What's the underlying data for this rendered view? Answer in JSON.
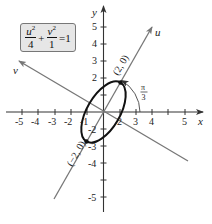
{
  "diagram": {
    "equation": {
      "u_term": {
        "var": "u",
        "exp": "2",
        "den": "4"
      },
      "plus": "+",
      "v_term": {
        "var": "v",
        "exp": "2",
        "den": "1"
      },
      "equals": "=1"
    },
    "axes": {
      "x_label": "x",
      "y_label": "y",
      "u_label": "u",
      "v_label": "v",
      "x_ticks": [
        "-5",
        "-4",
        "-3",
        "-2",
        "-1",
        "2",
        "3",
        "4",
        "5"
      ],
      "y_ticks": [
        "5",
        "4",
        "3",
        "2",
        "-2",
        "-3",
        "-4",
        "-5"
      ],
      "x_range": [
        -5,
        5
      ],
      "y_range": [
        -5,
        5
      ]
    },
    "rotation_angle_label_num": "π",
    "rotation_angle_label_den": "3",
    "vertex_labels": {
      "positive": "(2, 0)",
      "negative": "(−2, 0)"
    },
    "ellipse": {
      "semi_major": 2,
      "semi_minor": 1,
      "rotation_deg": 60
    },
    "colors": {
      "axis": "#333333",
      "rotated_axis": "#777777",
      "ellipse": "#111111",
      "formula_bg": "#e6e6e6"
    }
  }
}
